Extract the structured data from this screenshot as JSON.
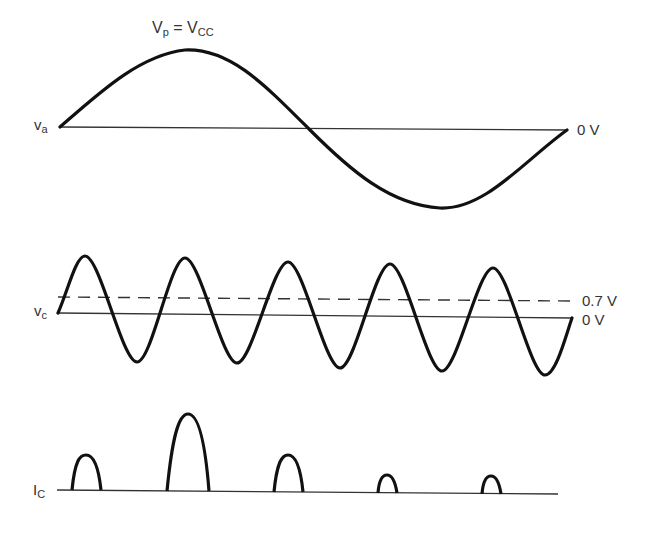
{
  "labels": {
    "peak": {
      "main": "V",
      "sub": "p",
      "eq": " = ",
      "main2": "V",
      "sub2": "CC"
    },
    "va": {
      "main": "v",
      "sub": "a"
    },
    "va_zero": "0 V",
    "vc": {
      "main": "v",
      "sub": "c"
    },
    "vc_threshold": "0.7 V",
    "vc_zero": "0 V",
    "ic": {
      "main": "I",
      "sub": "C"
    }
  },
  "colors": {
    "waveform": "#111111",
    "axis": "#333333",
    "dashed": "#333333",
    "background": "#ffffff"
  },
  "waveforms": {
    "va": {
      "type": "sine",
      "cycles": 1,
      "baseline_y": 127,
      "x_start": 60,
      "x_end": 567,
      "peak_y": 50,
      "trough_y": 208
    },
    "vc": {
      "type": "sine",
      "cycles": 5,
      "baseline_y_start": 313,
      "baseline_y_end": 318,
      "x_start": 58,
      "x_end": 572,
      "peaks_x": [
        85,
        185,
        288,
        390,
        493
      ],
      "troughs_x": [
        137,
        237,
        340,
        442,
        545
      ],
      "threshold_y": 297
    },
    "ic": {
      "type": "pulses",
      "baseline_y": 490,
      "x_start": 57,
      "x_end": 558,
      "pulses": [
        {
          "x0": 72,
          "x1": 101,
          "peak_y": 455
        },
        {
          "x0": 167,
          "x1": 209,
          "peak_y": 414
        },
        {
          "x0": 274,
          "x1": 303,
          "peak_y": 455
        },
        {
          "x0": 378,
          "x1": 397,
          "peak_y": 475
        },
        {
          "x0": 482,
          "x1": 501,
          "peak_y": 476
        }
      ]
    }
  }
}
